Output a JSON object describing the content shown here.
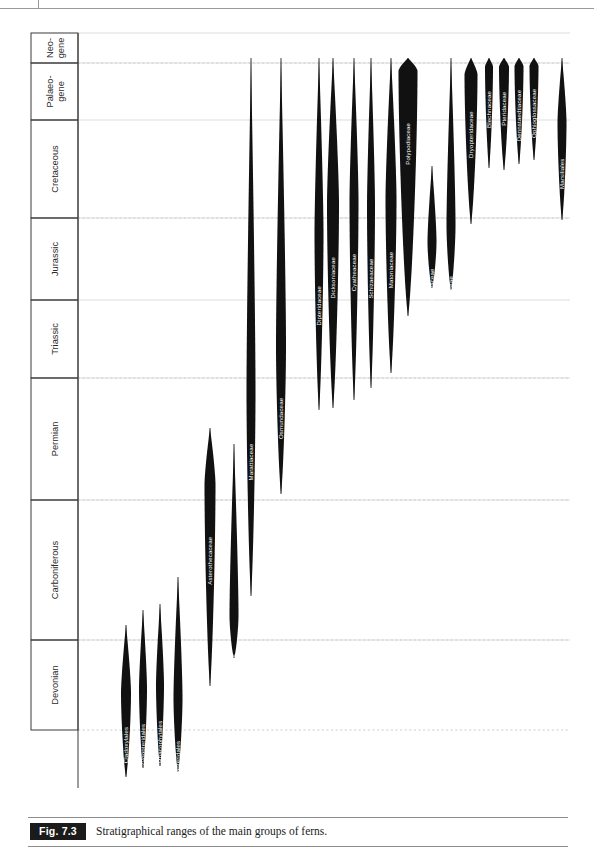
{
  "caption": {
    "figure_tag": "Fig. 7.3",
    "text": "Stratigraphical ranges of the main groups of ferns."
  },
  "chart_data": {
    "type": "range-chart",
    "title": "Stratigraphical ranges of the main groups of ferns.",
    "xlabel": "",
    "ylabel": "",
    "grid": true,
    "axis_note": "Vertical axis is geological time, oldest (Devonian) at bottom, youngest (Neogene) at top.",
    "periods": [
      {
        "label": "Neo-\ngene",
        "name": "Neogene",
        "y_top": 5,
        "y_bottom": 35,
        "solid_boundary": true
      },
      {
        "label": "Palaeo-\ngene",
        "name": "Palaeogene",
        "y_top": 35,
        "y_bottom": 92,
        "solid_boundary": true
      },
      {
        "label": "Cretaceous",
        "name": "Cretaceous",
        "y_top": 92,
        "y_bottom": 190,
        "solid_boundary": true
      },
      {
        "label": "Jurassic",
        "name": "Jurassic",
        "y_top": 190,
        "y_bottom": 272,
        "solid_boundary": true
      },
      {
        "label": "Triassic",
        "name": "Triassic",
        "y_top": 272,
        "y_bottom": 350,
        "solid_boundary": true
      },
      {
        "label": "Permian",
        "name": "Permian",
        "y_top": 350,
        "y_bottom": 472,
        "solid_boundary": true
      },
      {
        "label": "Carboniferous",
        "name": "Carboniferous",
        "y_top": 472,
        "y_bottom": 612,
        "solid_boundary": true
      },
      {
        "label": "Devonian",
        "name": "Devonian",
        "y_top": 612,
        "y_bottom": 702,
        "solid_boundary": true
      }
    ],
    "dashed_gridlines_y": [
      35,
      190,
      350,
      472,
      612,
      702
    ],
    "taxa": [
      {
        "name": "Cladoxylales",
        "x": 96,
        "top": 597,
        "bottom": 749,
        "max_width": 10,
        "peak": 0.45,
        "label_rotated": true,
        "label_color": "light"
      },
      {
        "name": "Zygopteridales",
        "x": 113,
        "top": 582,
        "bottom": 740,
        "max_width": 8,
        "peak": 0.5,
        "label_rotated": true,
        "label_color": "light"
      },
      {
        "name": "Rhacophytales",
        "x": 130,
        "top": 576,
        "bottom": 738,
        "max_width": 8,
        "peak": 0.5,
        "label_rotated": true,
        "label_color": "light"
      },
      {
        "name": "Stauropteridales",
        "x": 148,
        "top": 549,
        "bottom": 744,
        "max_width": 9,
        "peak": 0.62,
        "label_rotated": true,
        "label_color": "light"
      },
      {
        "name": "Asterothecaceae",
        "x": 180,
        "top": 400,
        "bottom": 658,
        "max_width": 11,
        "peak": 0.22,
        "label_rotated": true,
        "label_color": "light"
      },
      {
        "name": "Urnatopteridales",
        "x": 204,
        "top": 416,
        "bottom": 630,
        "max_width": 9,
        "peak": 0.8,
        "label_rotated": true,
        "label_color": "light"
      },
      {
        "name": "Marattiaceae",
        "x": 221,
        "top": 30,
        "bottom": 568,
        "max_width": 9,
        "peak": 0.62,
        "label_rotated": true,
        "label_color": "light"
      },
      {
        "name": "Osmundaceae",
        "x": 251,
        "top": 30,
        "bottom": 466,
        "max_width": 10,
        "peak": 0.66,
        "label_rotated": true,
        "label_color": "light"
      },
      {
        "name": "Dipteridaceae",
        "x": 289,
        "top": 30,
        "bottom": 382,
        "max_width": 9,
        "peak": 0.5,
        "label_rotated": true,
        "label_color": "light"
      },
      {
        "name": "Dicksoniaceae",
        "x": 303,
        "top": 30,
        "bottom": 380,
        "max_width": 12,
        "peak": 0.42,
        "label_rotated": true,
        "label_color": "light"
      },
      {
        "name": "Cyatheaceae",
        "x": 324,
        "top": 30,
        "bottom": 372,
        "max_width": 9,
        "peak": 0.42,
        "label_rotated": true,
        "label_color": "light"
      },
      {
        "name": "Schizaeaceae",
        "x": 341,
        "top": 30,
        "bottom": 360,
        "max_width": 8,
        "peak": 0.45,
        "label_rotated": true,
        "label_color": "light"
      },
      {
        "name": "Matoniaceae",
        "x": 361,
        "top": 30,
        "bottom": 345,
        "max_width": 11,
        "peak": 0.45,
        "label_rotated": true,
        "label_color": "light"
      },
      {
        "name": "Polypodiaceae",
        "x": 378,
        "top": 30,
        "bottom": 288,
        "max_width": 19,
        "peak": 0.05,
        "label_rotated": true,
        "label_color": "light"
      },
      {
        "name": "Tempskyaceae",
        "x": 402,
        "top": 138,
        "bottom": 260,
        "max_width": 9,
        "peak": 0.62,
        "label_rotated": true,
        "label_color": "light"
      },
      {
        "name": "Gleicheniaceae",
        "x": 421,
        "top": 30,
        "bottom": 262,
        "max_width": 9,
        "peak": 0.72,
        "label_rotated": true,
        "label_color": "light"
      },
      {
        "name": "Dryopteridaceae",
        "x": 441,
        "top": 30,
        "bottom": 196,
        "max_width": 13,
        "peak": 0.1,
        "label_rotated": true,
        "label_color": "light"
      },
      {
        "name": "Blechnaceae",
        "x": 459,
        "top": 30,
        "bottom": 140,
        "max_width": 8,
        "peak": 0.08,
        "label_rotated": true,
        "label_color": "light"
      },
      {
        "name": "Pteridaceae",
        "x": 474,
        "top": 30,
        "bottom": 142,
        "max_width": 10,
        "peak": 0.08,
        "label_rotated": true,
        "label_color": "light"
      },
      {
        "name": "Dennstaedtiaceae",
        "x": 489,
        "top": 30,
        "bottom": 136,
        "max_width": 9,
        "peak": 0.08,
        "label_rotated": true,
        "label_color": "light"
      },
      {
        "name": "Ophioglossaceae",
        "x": 504,
        "top": 30,
        "bottom": 132,
        "max_width": 9,
        "peak": 0.08,
        "label_rotated": true,
        "label_color": "light"
      },
      {
        "name": "Marsiliales",
        "x": 532,
        "top": 30,
        "bottom": 192,
        "max_width": 9,
        "peak": 0.4,
        "label_rotated": true,
        "label_color": "light"
      },
      {
        "name": "Salviniales",
        "x": 552,
        "top": 30,
        "bottom": 160,
        "max_width": 9,
        "peak": 0.3,
        "label_rotated": true,
        "label_color": "light"
      }
    ]
  }
}
